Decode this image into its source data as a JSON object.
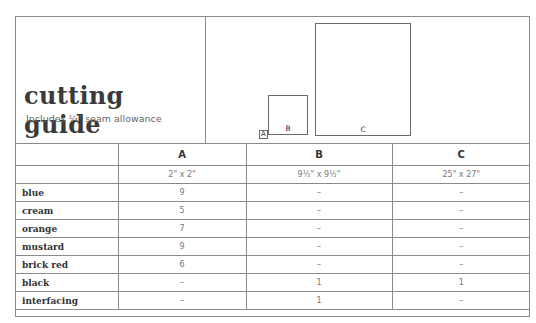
{
  "header": {
    "title": "cutting guide",
    "subtitle": "Includes ¼\" seam allowance",
    "diagram": {
      "pieces": [
        {
          "label": "A"
        },
        {
          "label": "B"
        },
        {
          "label": "C"
        }
      ]
    }
  },
  "table": {
    "columns": [
      "",
      "A",
      "B",
      "C"
    ],
    "sizes": [
      "",
      "2\" x 2\"",
      "9½\" x 9½\"",
      "25\" x 27\""
    ],
    "rows": [
      {
        "label": "blue",
        "cells": [
          "9",
          "–",
          "–"
        ]
      },
      {
        "label": "cream",
        "cells": [
          "5",
          "–",
          "–"
        ]
      },
      {
        "label": "orange",
        "cells": [
          "7",
          "–",
          "–"
        ]
      },
      {
        "label": "mustard",
        "cells": [
          "9",
          "–",
          "–"
        ]
      },
      {
        "label": "brick red",
        "cells": [
          "6",
          "–",
          "–"
        ]
      },
      {
        "label": "black",
        "cells": [
          "–",
          "1",
          "1"
        ]
      },
      {
        "label": "interfacing",
        "cells": [
          "–",
          "1",
          "–"
        ]
      }
    ]
  }
}
